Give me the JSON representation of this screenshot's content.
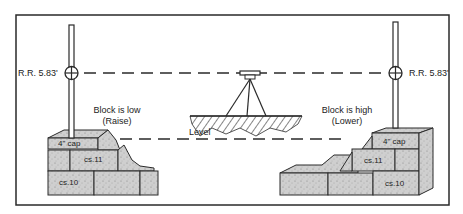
{
  "diagram": {
    "left_rod": {
      "reading": "R.R. 5.83'"
    },
    "right_rod": {
      "reading": "R.R. 5.83'"
    },
    "left_note": {
      "line1": "Block is low",
      "line2": "(Raise)"
    },
    "right_note": {
      "line1": "Block is high",
      "line2": "(Lower)"
    },
    "instrument_label": "Level",
    "left_wall": {
      "cap": "4\" cap",
      "course_upper": "cs.11",
      "course_lower": "cs.10"
    },
    "right_wall": {
      "cap": "4\" cap",
      "course_upper": "cs.11",
      "course_lower": "cs.10"
    },
    "colors": {
      "line": "#2a2a2a",
      "block_fill": "#c9c9c9",
      "background": "#ffffff"
    }
  }
}
